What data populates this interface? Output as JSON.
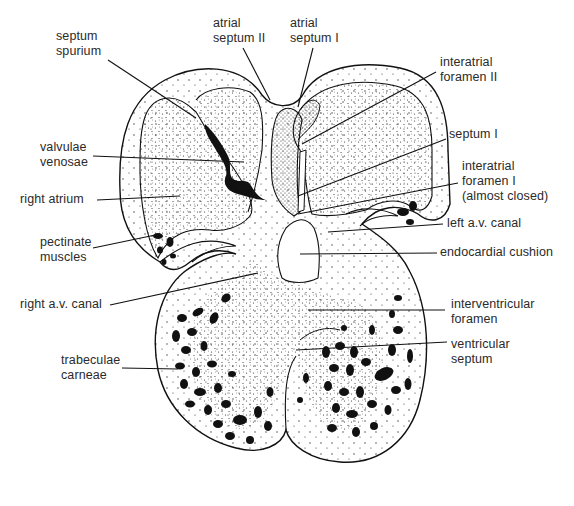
{
  "diagram": {
    "colors": {
      "ink": "#111111",
      "label_text": "#2a2a2a",
      "background": "#ffffff",
      "stipple": "#333333"
    },
    "labels": [
      {
        "id": "septum-spurium",
        "text": "septum\nspurium",
        "x": 56,
        "y": 29
      },
      {
        "id": "atrial-septum-ii",
        "text": "atrial\nseptum II",
        "x": 213,
        "y": 16
      },
      {
        "id": "atrial-septum-i",
        "text": "atrial\nseptum I",
        "x": 290,
        "y": 16
      },
      {
        "id": "interatrial-foramen-ii",
        "text": "interatrial\nforamen II",
        "x": 440,
        "y": 55
      },
      {
        "id": "valvulae-venosae",
        "text": "valvulae\nvenosae",
        "x": 40,
        "y": 140
      },
      {
        "id": "septum-i",
        "text": "septum I",
        "x": 449,
        "y": 127
      },
      {
        "id": "interatrial-foramen-i",
        "text": "interatrial\nforamen I\n(almost closed)",
        "x": 462,
        "y": 159
      },
      {
        "id": "right-atrium",
        "text": "right atrium",
        "x": 20,
        "y": 192
      },
      {
        "id": "left-av-canal",
        "text": "left a.v. canal",
        "x": 447,
        "y": 216
      },
      {
        "id": "pectinate-muscles",
        "text": "pectinate\nmuscles",
        "x": 40,
        "y": 235
      },
      {
        "id": "endocardial-cushion",
        "text": "endocardial cushion",
        "x": 440,
        "y": 245
      },
      {
        "id": "right-av-canal",
        "text": "right a.v. canal",
        "x": 20,
        "y": 297
      },
      {
        "id": "interventricular-foramen",
        "text": "interventricular\nforamen",
        "x": 451,
        "y": 297
      },
      {
        "id": "ventricular-septum",
        "text": "ventricular\nseptum",
        "x": 451,
        "y": 337
      },
      {
        "id": "trabeculae-carneae",
        "text": "trabeculae\ncarneae",
        "x": 61,
        "y": 353
      }
    ],
    "leader_lines": [
      {
        "label": "septum-spurium",
        "x1": 108,
        "y1": 60,
        "x2": 196,
        "y2": 118
      },
      {
        "label": "atrial-septum-ii",
        "x1": 243,
        "y1": 48,
        "x2": 270,
        "y2": 100
      },
      {
        "label": "atrial-septum-i",
        "x1": 313,
        "y1": 48,
        "x2": 298,
        "y2": 107
      },
      {
        "label": "interatrial-foramen-ii",
        "x1": 436,
        "y1": 72,
        "x2": 302,
        "y2": 144
      },
      {
        "label": "valvulae-venosae",
        "x1": 93,
        "y1": 156,
        "x2": 244,
        "y2": 162
      },
      {
        "label": "septum-i",
        "x1": 446,
        "y1": 139,
        "x2": 298,
        "y2": 196
      },
      {
        "label": "interatrial-foramen-i",
        "x1": 458,
        "y1": 183,
        "x2": 298,
        "y2": 214
      },
      {
        "label": "right-atrium",
        "x1": 97,
        "y1": 200,
        "x2": 180,
        "y2": 196
      },
      {
        "label": "left-av-canal",
        "x1": 443,
        "y1": 224,
        "x2": 328,
        "y2": 232
      },
      {
        "label": "pectinate-muscles",
        "x1": 93,
        "y1": 248,
        "x2": 160,
        "y2": 234
      },
      {
        "label": "endocardial-cushion",
        "x1": 437,
        "y1": 253,
        "x2": 300,
        "y2": 254
      },
      {
        "label": "right-av-canal",
        "x1": 110,
        "y1": 305,
        "x2": 258,
        "y2": 273
      },
      {
        "label": "interventricular-foramen",
        "x1": 445,
        "y1": 310,
        "x2": 308,
        "y2": 310
      },
      {
        "label": "ventricular-septum",
        "x1": 447,
        "y1": 342,
        "x2": 296,
        "y2": 350
      },
      {
        "label": "trabeculae-carneae",
        "x1": 122,
        "y1": 368,
        "x2": 178,
        "y2": 369
      }
    ]
  }
}
